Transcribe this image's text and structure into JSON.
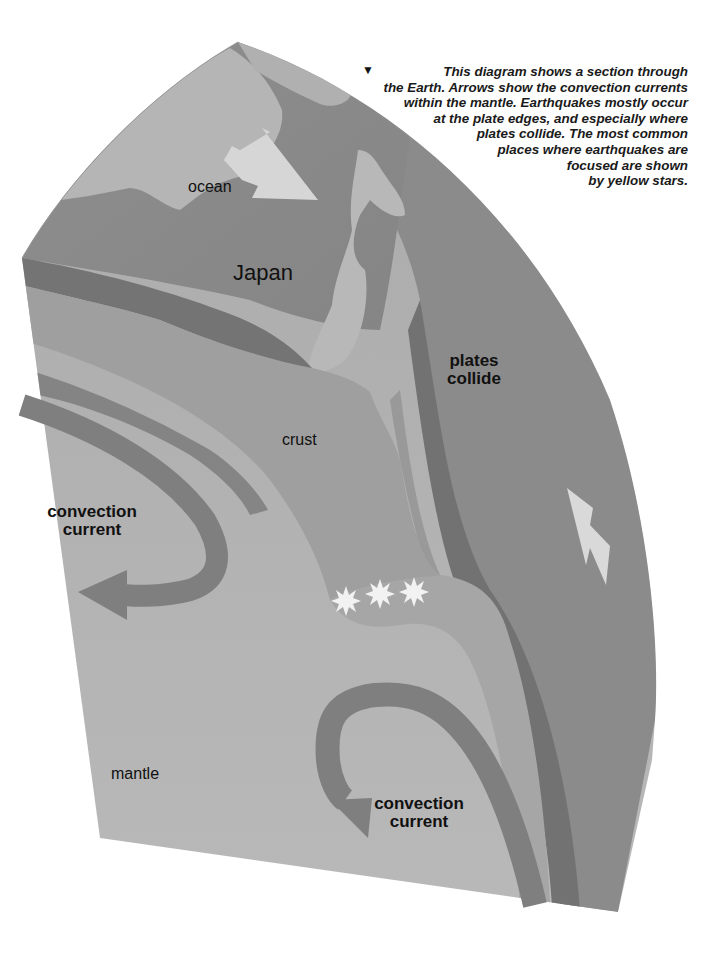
{
  "caption": {
    "marker": "▼",
    "lines": [
      "This diagram shows a section through",
      "the Earth. Arrows show the convection currents",
      "within the mantle. Earthquakes mostly occur",
      "at the plate edges, and especially where",
      "plates collide. The most common",
      "places where earthquakes are",
      "focused are shown",
      "by yellow stars."
    ]
  },
  "labels": {
    "ocean": "ocean",
    "japan": "Japan",
    "plates_collide_1": "plates",
    "plates_collide_2": "collide",
    "crust": "crust",
    "convection_left_1": "convection",
    "convection_left_2": "current",
    "mantle": "mantle",
    "convection_bottom_1": "convection",
    "convection_bottom_2": "current"
  },
  "icons": {
    "arrow_ocean": "white-arrow-plate-motion",
    "arrow_right": "white-arrow-plate-motion-up",
    "stars": [
      "earthquake-focus-star",
      "earthquake-focus-star",
      "earthquake-focus-star"
    ]
  },
  "colors": {
    "background": "#ffffff",
    "ocean_surface": "#8a8a8a",
    "land": "#b4b4b4",
    "crust_layer": "#9c9c9c",
    "dark_band": "#747474",
    "mantle": "#b2b2b2",
    "right_plate": "#8c8c8c",
    "convection_arrow": "#808080",
    "star": "#f2f2f2",
    "text": "#111111"
  }
}
